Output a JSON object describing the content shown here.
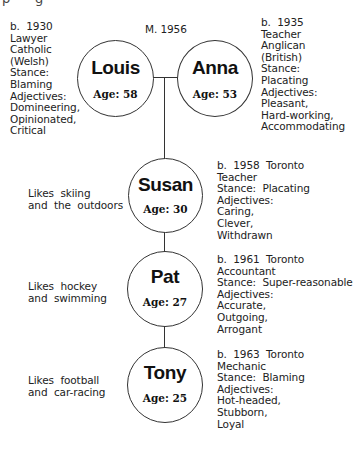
{
  "page_fragment": "p      g",
  "marriage": {
    "label": "M. 1956"
  },
  "parents": [
    {
      "name": "Louis",
      "age": "Age:  58",
      "details": "b.  1930\nLawyer\nCatholic\n(Welsh)\nStance:\nBlaming\nAdjectives:\nDomineering,\nOpinionated,\nCritical"
    },
    {
      "name": "Anna",
      "age": "Age:  53",
      "details": "b.  1935\nTeacher\nAnglican\n(British)\nStance:\nPlacating\nAdjectives:\nPleasant,\nHard-working,\nAccommodating"
    }
  ],
  "children": [
    {
      "name": "Susan",
      "age": "Age:  30",
      "likes": "Likes  skiing\nand  the  outdoors",
      "details": "b.  1958  Toronto\nTeacher\nStance:  Placating\nAdjectives:\nCaring,\nClever,\nWithdrawn"
    },
    {
      "name": "Pat",
      "age": "Age:  27",
      "likes": "Likes  hockey\nand  swimming",
      "details": "b.  1961  Toronto\nAccountant\nStance:  Super-reasonable\nAdjectives:\nAccurate,\nOutgoing,\nArrogant"
    },
    {
      "name": "Tony",
      "age": "Age:  25",
      "likes": "Likes  football\nand  car-racing",
      "details": "b.  1963  Toronto\nMechanic\nStance:  Blaming\nAdjectives:\nHot-headed,\nStubborn,\nLoyal"
    }
  ]
}
